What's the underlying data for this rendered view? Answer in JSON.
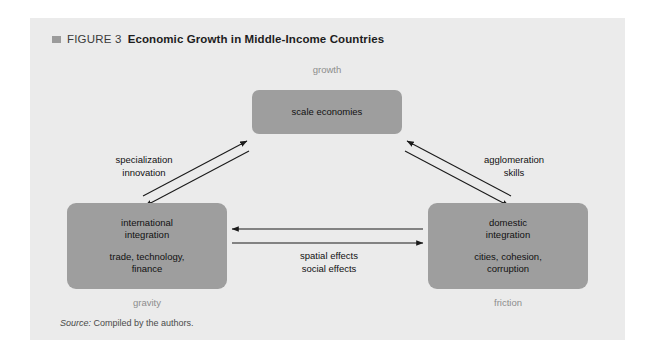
{
  "figure": {
    "marker_icon": "square-marker-icon",
    "number": "FIGURE 3",
    "title": "Economic Growth in Middle-Income Countries"
  },
  "diagram": {
    "type": "triangle-relationship-diagram",
    "nodes": [
      {
        "id": "scale-economies",
        "primary": "scale economies",
        "secondary": "",
        "corner_label": "growth"
      },
      {
        "id": "international-integration",
        "primary_line1": "international",
        "primary_line2": "integration",
        "secondary_line1": "trade, technology,",
        "secondary_line2": "finance",
        "corner_label": "gravity"
      },
      {
        "id": "domestic-integration",
        "primary_line1": "domestic",
        "primary_line2": "integration",
        "secondary_line1": "cities, cohesion,",
        "secondary_line2": "corruption",
        "corner_label": "friction"
      }
    ],
    "edge_labels": {
      "left_line1": "specialization",
      "left_line2": "innovation",
      "right_line1": "agglomeration",
      "right_line2": "skills",
      "bottom_line1": "spatial effects",
      "bottom_line2": "social effects"
    },
    "colors": {
      "node_fill": "#9e9e9e",
      "panel_background": "#ebebeb",
      "corner_label_text": "#8d8d8d",
      "arrow_stroke": "#1a1a1a"
    }
  },
  "source": {
    "label": "Source:",
    "text": "Compiled by the authors."
  }
}
